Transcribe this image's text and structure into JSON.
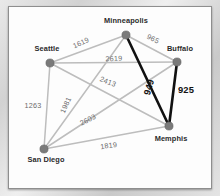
{
  "figure": {
    "colors": {
      "edge": "#bdbdbd",
      "edge_highlight": "#111111",
      "node": "#7a7a7a",
      "panel": "#fdfdfd",
      "page": "#d6d6d6"
    },
    "nodes": [
      {
        "id": "seattle",
        "label": "Seattle",
        "x": 49,
        "y": 62,
        "lx": 46,
        "ly": 50,
        "anchor": "middle"
      },
      {
        "id": "minneapolis",
        "label": "Minneapolis",
        "x": 125,
        "y": 34,
        "lx": 125,
        "ly": 22,
        "anchor": "middle"
      },
      {
        "id": "buffalo",
        "label": "Buffalo",
        "x": 176,
        "y": 61,
        "lx": 179,
        "ly": 50,
        "anchor": "middle"
      },
      {
        "id": "memphis",
        "label": "Memphis",
        "x": 168,
        "y": 125,
        "lx": 170,
        "ly": 140,
        "anchor": "middle"
      },
      {
        "id": "sandiego",
        "label": "San Diego",
        "x": 43,
        "y": 148,
        "lx": 45,
        "ly": 161,
        "anchor": "middle"
      }
    ],
    "edges": [
      {
        "id": "seattle-minneapolis",
        "from": "seattle",
        "to": "minneapolis",
        "weight": "1619",
        "highlight": false,
        "lx": 81,
        "ly": 44,
        "rot": -24
      },
      {
        "id": "minneapolis-buffalo",
        "from": "minneapolis",
        "to": "buffalo",
        "weight": "965",
        "highlight": false,
        "lx": 151,
        "ly": 40,
        "rot": 26
      },
      {
        "id": "seattle-buffalo",
        "from": "seattle",
        "to": "buffalo",
        "weight": "2619",
        "highlight": false,
        "lx": 113,
        "ly": 60,
        "rot": -2
      },
      {
        "id": "seattle-memphis",
        "from": "seattle",
        "to": "memphis",
        "weight": "2413",
        "highlight": false,
        "lx": 106,
        "ly": 83,
        "rot": 22
      },
      {
        "id": "seattle-sandiego",
        "from": "seattle",
        "to": "sandiego",
        "weight": "1263",
        "highlight": false,
        "lx": 32,
        "ly": 107,
        "rot": 0
      },
      {
        "id": "sandiego-minneapolis",
        "from": "sandiego",
        "to": "minneapolis",
        "weight": "1981",
        "highlight": false,
        "lx": 67,
        "ly": 105,
        "rot": -66
      },
      {
        "id": "sandiego-buffalo",
        "from": "sandiego",
        "to": "buffalo",
        "weight": "2603",
        "highlight": false,
        "lx": 88,
        "ly": 121,
        "rot": -27
      },
      {
        "id": "sandiego-memphis",
        "from": "sandiego",
        "to": "memphis",
        "weight": "1819",
        "highlight": false,
        "lx": 108,
        "ly": 147,
        "rot": -8
      },
      {
        "id": "minneapolis-memphis",
        "from": "minneapolis",
        "to": "memphis",
        "weight": "949",
        "highlight": true,
        "lx": 151,
        "ly": 87,
        "rot": -74
      },
      {
        "id": "buffalo-memphis",
        "from": "buffalo",
        "to": "memphis",
        "weight": "925",
        "highlight": true,
        "lx": 185,
        "ly": 92,
        "rot": 0
      }
    ]
  },
  "chart_data": {
    "type": "diagram",
    "nodes": [
      "Seattle",
      "Minneapolis",
      "Buffalo",
      "Memphis",
      "San Diego"
    ],
    "edges": [
      {
        "source": "Seattle",
        "target": "Minneapolis",
        "weight": 1619,
        "highlighted": false
      },
      {
        "source": "Minneapolis",
        "target": "Buffalo",
        "weight": 965,
        "highlighted": false
      },
      {
        "source": "Seattle",
        "target": "Buffalo",
        "weight": 2619,
        "highlighted": false
      },
      {
        "source": "Seattle",
        "target": "Memphis",
        "weight": 2413,
        "highlighted": false
      },
      {
        "source": "Seattle",
        "target": "San Diego",
        "weight": 1263,
        "highlighted": false
      },
      {
        "source": "San Diego",
        "target": "Minneapolis",
        "weight": 1981,
        "highlighted": false
      },
      {
        "source": "San Diego",
        "target": "Buffalo",
        "weight": 2603,
        "highlighted": false
      },
      {
        "source": "San Diego",
        "target": "Memphis",
        "weight": 1819,
        "highlighted": false
      },
      {
        "source": "Minneapolis",
        "target": "Memphis",
        "weight": 949,
        "highlighted": true
      },
      {
        "source": "Buffalo",
        "target": "Memphis",
        "weight": 925,
        "highlighted": true
      }
    ],
    "highlighted_path": [
      "Minneapolis",
      "Memphis",
      "Buffalo"
    ],
    "legend": [],
    "grid": false
  }
}
